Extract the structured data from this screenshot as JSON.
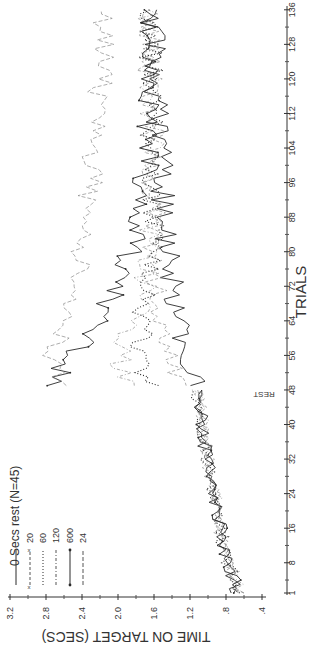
{
  "chart_data": {
    "type": "line",
    "orientation": "rotated-90-clockwise",
    "title": "",
    "xlabel": "TRIALS",
    "ylabel": "TIME ON TARGET (SECS)",
    "rest_label": "REST",
    "rest_after_trial": 48,
    "legend_title": "Secs rest (N=45)",
    "xticks": [
      1,
      8,
      16,
      24,
      32,
      40,
      48,
      56,
      64,
      72,
      80,
      88,
      96,
      104,
      112,
      120,
      128,
      136
    ],
    "yticks": [
      ".4",
      ".8",
      "1.2",
      "1.6",
      "2.0",
      "2.4",
      "2.8",
      "3.2"
    ],
    "ytick_values": [
      0.4,
      0.8,
      1.2,
      1.6,
      2.0,
      2.4,
      2.8,
      3.2
    ],
    "xlim": [
      1,
      136
    ],
    "ylim": [
      0.4,
      3.2
    ],
    "grid": false,
    "legend_position": "upper-left (bottom-left in rotated image)",
    "x": [
      1,
      5,
      9,
      13,
      17,
      21,
      25,
      29,
      33,
      37,
      41,
      45,
      48,
      49,
      53,
      57,
      61,
      65,
      69,
      73,
      77,
      81,
      85,
      89,
      93,
      97,
      101,
      105,
      109,
      113,
      117,
      121,
      125,
      129,
      133,
      136
    ],
    "series": [
      {
        "name": "0",
        "style": "solid",
        "values": [
          0.68,
          0.74,
          0.8,
          0.84,
          0.88,
          0.92,
          0.95,
          0.99,
          1.02,
          1.05,
          1.08,
          1.1,
          1.12,
          1.14,
          1.18,
          1.22,
          1.28,
          1.32,
          1.36,
          1.4,
          1.42,
          1.44,
          1.47,
          1.48,
          1.5,
          1.52,
          1.53,
          1.55,
          1.56,
          1.57,
          1.58,
          1.6,
          1.6,
          1.61,
          1.62,
          1.62
        ]
      },
      {
        "name": "20",
        "style": "x-dashed",
        "values": [
          0.66,
          0.72,
          0.78,
          0.83,
          0.87,
          0.91,
          0.94,
          0.98,
          1.01,
          1.04,
          1.07,
          1.09,
          1.11,
          1.25,
          1.4,
          1.48,
          1.52,
          1.55,
          1.56,
          1.58,
          1.58,
          1.6,
          1.6,
          1.61,
          1.62,
          1.63,
          1.63,
          1.64,
          1.64,
          1.65,
          1.66,
          1.66,
          1.67,
          1.67,
          1.68,
          1.68
        ]
      },
      {
        "name": "60",
        "style": "dotted",
        "values": [
          0.67,
          0.73,
          0.79,
          0.84,
          0.88,
          0.92,
          0.96,
          0.99,
          1.03,
          1.06,
          1.08,
          1.11,
          1.13,
          1.62,
          1.72,
          1.76,
          1.74,
          1.72,
          1.68,
          1.66,
          1.65,
          1.64,
          1.63,
          1.63,
          1.62,
          1.62,
          1.62,
          1.62,
          1.62,
          1.63,
          1.63,
          1.63,
          1.64,
          1.64,
          1.64,
          1.65
        ]
      },
      {
        "name": "120",
        "style": "dash-dot",
        "values": [
          0.65,
          0.71,
          0.77,
          0.82,
          0.86,
          0.9,
          0.94,
          0.97,
          1.01,
          1.04,
          1.07,
          1.09,
          1.11,
          1.95,
          2.0,
          1.96,
          1.88,
          1.8,
          1.74,
          1.7,
          1.67,
          1.65,
          1.64,
          1.63,
          1.63,
          1.62,
          1.62,
          1.62,
          1.63,
          1.63,
          1.63,
          1.64,
          1.64,
          1.64,
          1.65,
          1.65
        ]
      },
      {
        "name": "600",
        "style": "solid-dots",
        "values": [
          0.66,
          0.72,
          0.78,
          0.83,
          0.87,
          0.91,
          0.95,
          0.98,
          1.02,
          1.05,
          1.07,
          1.1,
          1.12,
          2.7,
          2.62,
          2.45,
          2.3,
          2.22,
          2.1,
          2.0,
          1.92,
          1.85,
          1.8,
          1.76,
          1.72,
          1.7,
          1.68,
          1.67,
          1.66,
          1.65,
          1.65,
          1.65,
          1.66,
          1.66,
          1.66,
          1.67
        ]
      },
      {
        "name": "24",
        "style": "dashed",
        "note": "24 hrs rest",
        "values": [
          0.67,
          0.73,
          0.79,
          0.84,
          0.88,
          0.92,
          0.95,
          0.99,
          1.02,
          1.05,
          1.08,
          1.1,
          1.12,
          2.55,
          2.72,
          2.7,
          2.66,
          2.6,
          2.55,
          2.5,
          2.45,
          2.42,
          2.38,
          2.35,
          2.32,
          2.3,
          2.28,
          2.26,
          2.24,
          2.22,
          2.2,
          2.18,
          2.16,
          2.15,
          2.14,
          2.13
        ]
      }
    ]
  },
  "legend": {
    "title_prefix": "0",
    "title": "Secs rest (N=45)",
    "items": [
      {
        "label": "0",
        "style": "solid"
      },
      {
        "label": "20",
        "style": "x-dashed"
      },
      {
        "label": "60",
        "style": "dotted"
      },
      {
        "label": "120",
        "style": "dash-dot"
      },
      {
        "label": "600",
        "style": "solid-dots"
      },
      {
        "label": "24",
        "style": "dashed"
      }
    ]
  },
  "colors": {
    "ink": "#2a2a2a",
    "ink_light": "#8a8a8a",
    "background": "#ffffff"
  }
}
